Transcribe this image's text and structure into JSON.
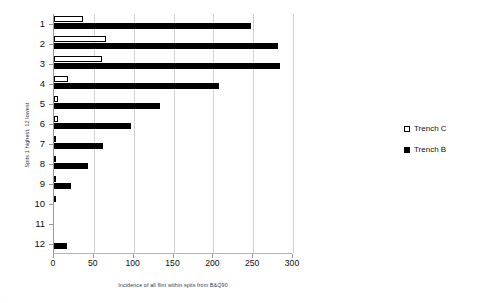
{
  "chart_data": {
    "type": "bar",
    "orientation": "horizontal",
    "title": "",
    "xlabel": "Incidence of all flint within spits from B&Q90",
    "ylabel": "Spits 1 highest, 12 lowest",
    "categories": [
      "1",
      "2",
      "3",
      "4",
      "5",
      "6",
      "7",
      "8",
      "9",
      "10",
      "11",
      "12"
    ],
    "series": [
      {
        "name": "Trench C",
        "style": "open",
        "color": "#ffffff",
        "edge_color": "#000000",
        "values": [
          37,
          65,
          60,
          17,
          5,
          5,
          1.5,
          1.5,
          1,
          1,
          0,
          0
        ]
      },
      {
        "name": "Trench B",
        "style": "solid",
        "color": "#000000",
        "edge_color": "#000000",
        "values": [
          247,
          281,
          284,
          207,
          133,
          97,
          62,
          43,
          21,
          0,
          0,
          16
        ]
      }
    ],
    "xlim": [
      0,
      300
    ],
    "ylim_categories": 12,
    "xticks": [
      0,
      50,
      100,
      150,
      200,
      250,
      300
    ],
    "xtick_labels": [
      "0",
      "50",
      "100",
      "150",
      "200",
      "250",
      "300"
    ],
    "grid": "vertical",
    "grid_color": "#d2d2d2",
    "legend_position": "right",
    "legend": [
      "Trench C",
      "Trench B"
    ]
  },
  "legend": {
    "entries": [
      {
        "label": "Trench C",
        "swatch": "open-square-icon"
      },
      {
        "label": "Trench B",
        "swatch": "filled-square-icon"
      }
    ]
  },
  "axes": {
    "x_title": "Incidence of all flint within spits from B&Q90",
    "y_title": "Spits 1 highest, 12 lowest"
  }
}
